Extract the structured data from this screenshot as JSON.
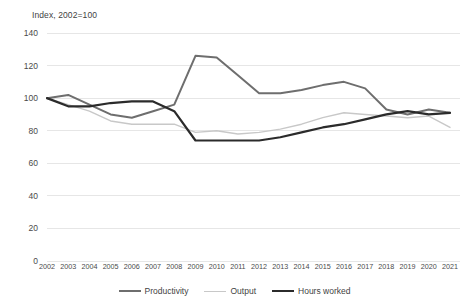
{
  "chart_data": {
    "type": "line",
    "title": "Index, 2002=100",
    "xlabel": "",
    "ylabel": "",
    "ylim": [
      0,
      140
    ],
    "ytick_step": 20,
    "yticks": [
      140,
      120,
      100,
      80,
      60,
      40,
      20,
      0
    ],
    "grid": true,
    "grid_axis": "y",
    "legend_position": "bottom",
    "categories": [
      "2002",
      "2003",
      "2004",
      "2005",
      "2006",
      "2007",
      "2008",
      "2009",
      "2010",
      "2011",
      "2012",
      "2013",
      "2014",
      "2015",
      "2016",
      "2017",
      "2018",
      "2019",
      "2020",
      "2021"
    ],
    "series": [
      {
        "name": "Productivity",
        "color": "#6e6e6e",
        "width": 2.0,
        "values": [
          100,
          102,
          96,
          90,
          88,
          92,
          96,
          126,
          125,
          114,
          103,
          103,
          105,
          108,
          110,
          106,
          93,
          90,
          93,
          91
        ]
      },
      {
        "name": "Output",
        "color": "#c8c8c8",
        "width": 1.4,
        "values": [
          100,
          96,
          92,
          86,
          84,
          84,
          84,
          79,
          80,
          78,
          79,
          81,
          84,
          88,
          91,
          90,
          89,
          88,
          89,
          82
        ]
      },
      {
        "name": "Hours worked",
        "color": "#2b2b2b",
        "width": 2.2,
        "values": [
          100,
          95,
          95,
          97,
          98,
          98,
          92,
          74,
          74,
          74,
          74,
          76,
          79,
          82,
          84,
          87,
          90,
          92,
          90,
          91
        ]
      }
    ]
  },
  "legend": {
    "items": [
      {
        "label": "Productivity",
        "color": "#6e6e6e",
        "width": "2.2px"
      },
      {
        "label": "Output",
        "color": "#c8c8c8",
        "width": "1.6px"
      },
      {
        "label": "Hours worked",
        "color": "#2b2b2b",
        "width": "2.6px"
      }
    ]
  },
  "colors": {
    "grid": "#e6e6e6",
    "text": "#4a4a4a",
    "background": "#ffffff"
  }
}
